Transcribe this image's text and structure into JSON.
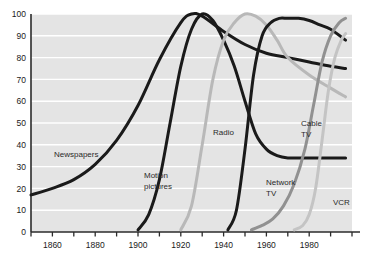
{
  "chart_data": {
    "type": "line",
    "title": "",
    "subtitle": "",
    "xlabel": "",
    "ylabel": "",
    "xlim": [
      1850,
      2000
    ],
    "ylim": [
      0,
      100
    ],
    "grid": true,
    "legend": "inline-labels",
    "y_ticks": [
      0,
      10,
      20,
      30,
      40,
      50,
      60,
      70,
      80,
      90,
      100
    ],
    "y_tick_labels": [
      "0",
      "10",
      "20",
      "30",
      "40",
      "50",
      "60",
      "70",
      "80",
      "90",
      "100"
    ],
    "x_ticks": [
      1850,
      1860,
      1870,
      1880,
      1890,
      1900,
      1910,
      1920,
      1930,
      1940,
      1950,
      1960,
      1970,
      1980,
      1990,
      2000
    ],
    "x_tick_labels_shown": [
      "1860",
      "1880",
      "1900",
      "1920",
      "1940",
      "1960",
      "1980"
    ],
    "x_tick_label_years": [
      1860,
      1880,
      1900,
      1920,
      1940,
      1960,
      1980
    ],
    "colors": {
      "newspapers": "#1a1a1a",
      "motion_pictures": "#1a1a1a",
      "radio": "#b8b8b8",
      "network_tv": "#1a1a1a",
      "cable_tv": "#919191",
      "vcr": "#c4c4c4",
      "plot_background": "#e4e4e4",
      "gridline": "#ffffff",
      "axis": "#2b2b2b"
    },
    "series": [
      {
        "name": "Newspapers",
        "label": "Newspapers",
        "label_lines": [
          "Newspapers"
        ],
        "color_key": "newspapers",
        "x": [
          1850,
          1860,
          1870,
          1880,
          1890,
          1900,
          1910,
          1920,
          1925,
          1930,
          1940,
          1950,
          1960,
          1970,
          1980,
          1990,
          1997
        ],
        "values": [
          17,
          20,
          24,
          31,
          42,
          58,
          79,
          96,
          100,
          99,
          92,
          86,
          82,
          80,
          78,
          76,
          75
        ]
      },
      {
        "name": "Motion pictures",
        "label": "Motion pictures",
        "label_lines": [
          "Motion",
          "pictures"
        ],
        "color_key": "motion_pictures",
        "x": [
          1900,
          1905,
          1910,
          1915,
          1920,
          1925,
          1930,
          1935,
          1940,
          1945,
          1950,
          1955,
          1960,
          1965,
          1970,
          1980,
          1990,
          1997
        ],
        "values": [
          1,
          8,
          24,
          50,
          76,
          93,
          100,
          97,
          88,
          76,
          60,
          45,
          38,
          35,
          34,
          34,
          34,
          34
        ]
      },
      {
        "name": "Radio",
        "label": "Radio",
        "label_lines": [
          "Radio"
        ],
        "color_key": "radio",
        "x": [
          1920,
          1925,
          1930,
          1935,
          1940,
          1945,
          1950,
          1955,
          1960,
          1965,
          1970,
          1980,
          1990,
          1997
        ],
        "values": [
          1,
          12,
          40,
          70,
          88,
          96,
          100,
          99,
          95,
          88,
          80,
          72,
          66,
          62
        ]
      },
      {
        "name": "Network TV",
        "label": "Network TV",
        "label_lines": [
          "Network",
          "TV"
        ],
        "color_key": "network_tv",
        "x": [
          1942,
          1946,
          1950,
          1954,
          1958,
          1962,
          1966,
          1970,
          1975,
          1980,
          1985,
          1990,
          1997
        ],
        "values": [
          1,
          10,
          38,
          72,
          90,
          96,
          98,
          98,
          98,
          97,
          95,
          93,
          88
        ]
      },
      {
        "name": "Cable TV",
        "label": "Cable TV",
        "label_lines": [
          "Cable",
          "TV"
        ],
        "color_key": "cable_tv",
        "x": [
          1953,
          1958,
          1963,
          1968,
          1973,
          1978,
          1982,
          1986,
          1990,
          1994,
          1997
        ],
        "values": [
          1,
          3,
          6,
          12,
          22,
          38,
          58,
          78,
          90,
          96,
          98
        ]
      },
      {
        "name": "VCR",
        "label": "VCR",
        "label_lines": [
          "VCR"
        ],
        "color_key": "vcr",
        "x": [
          1973,
          1977,
          1980,
          1983,
          1986,
          1989,
          1992,
          1995,
          1997
        ],
        "values": [
          1,
          3,
          8,
          20,
          42,
          65,
          80,
          88,
          91
        ]
      }
    ],
    "annotations": [
      {
        "text": "Newspapers",
        "x_px": 54,
        "y_px": 157
      },
      {
        "text": "Motion",
        "x_px": 144,
        "y_px": 178
      },
      {
        "text": "pictures",
        "x_px": 144,
        "y_px": 189
      },
      {
        "text": "Radio",
        "x_px": 213,
        "y_px": 135
      },
      {
        "text": "Cable",
        "x_px": 301,
        "y_px": 126
      },
      {
        "text": "TV",
        "x_px": 301,
        "y_px": 137
      },
      {
        "text": "Network",
        "x_px": 266,
        "y_px": 185
      },
      {
        "text": "TV",
        "x_px": 266,
        "y_px": 196
      },
      {
        "text": "VCR",
        "x_px": 333,
        "y_px": 205
      }
    ]
  }
}
